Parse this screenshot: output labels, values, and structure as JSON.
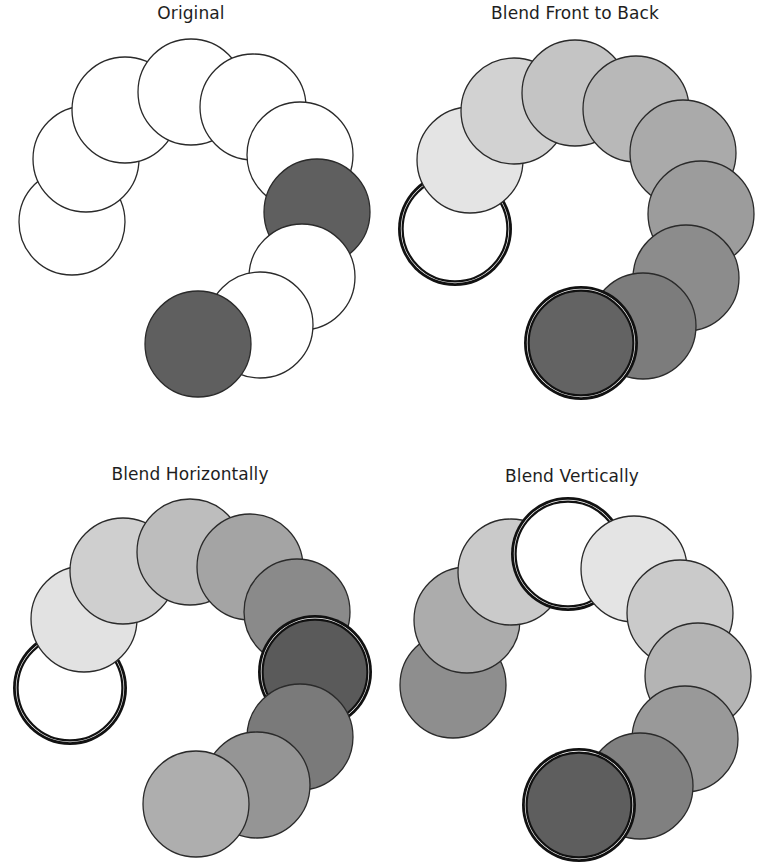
{
  "figure": {
    "circle_radius": 53,
    "stroke_color": "#2a2a2a",
    "panels": [
      {
        "id": "original",
        "title": "Original",
        "title_pos": [
          191,
          3
        ],
        "circles": [
          {
            "cx": 72,
            "cy": 222,
            "fill": "#ffffff",
            "selected": false
          },
          {
            "cx": 86,
            "cy": 159,
            "fill": "#ffffff",
            "selected": false
          },
          {
            "cx": 125,
            "cy": 110,
            "fill": "#ffffff",
            "selected": false
          },
          {
            "cx": 191,
            "cy": 92,
            "fill": "#ffffff",
            "selected": false
          },
          {
            "cx": 253,
            "cy": 107,
            "fill": "#ffffff",
            "selected": false
          },
          {
            "cx": 300,
            "cy": 155,
            "fill": "#ffffff",
            "selected": false
          },
          {
            "cx": 317,
            "cy": 212,
            "fill": "#5f5f5f",
            "selected": false
          },
          {
            "cx": 302,
            "cy": 277,
            "fill": "#ffffff",
            "selected": false
          },
          {
            "cx": 260,
            "cy": 325,
            "fill": "#ffffff",
            "selected": false
          },
          {
            "cx": 198,
            "cy": 344,
            "fill": "#5f5f5f",
            "selected": false
          }
        ]
      },
      {
        "id": "blend-front-to-back",
        "title": "Blend Front to Back",
        "title_pos": [
          575,
          3
        ],
        "circles": [
          {
            "cx": 455,
            "cy": 229,
            "fill": "#ffffff",
            "selected": true
          },
          {
            "cx": 470,
            "cy": 160,
            "fill": "#e4e4e4",
            "selected": false
          },
          {
            "cx": 514,
            "cy": 111,
            "fill": "#d2d2d2",
            "selected": false
          },
          {
            "cx": 575,
            "cy": 93,
            "fill": "#c4c4c4",
            "selected": false
          },
          {
            "cx": 636,
            "cy": 109,
            "fill": "#b8b8b8",
            "selected": false
          },
          {
            "cx": 683,
            "cy": 153,
            "fill": "#aaaaaa",
            "selected": false
          },
          {
            "cx": 701,
            "cy": 214,
            "fill": "#9c9c9c",
            "selected": false
          },
          {
            "cx": 686,
            "cy": 278,
            "fill": "#8c8c8c",
            "selected": false
          },
          {
            "cx": 643,
            "cy": 326,
            "fill": "#7c7c7c",
            "selected": false
          },
          {
            "cx": 581,
            "cy": 343,
            "fill": "#636363",
            "selected": true
          }
        ]
      },
      {
        "id": "blend-horizontally",
        "title": "Blend Horizontally",
        "title_pos": [
          190,
          464
        ],
        "circles": [
          {
            "cx": 70,
            "cy": 688,
            "fill": "#ffffff",
            "selected": true
          },
          {
            "cx": 84,
            "cy": 619,
            "fill": "#e2e2e2",
            "selected": false
          },
          {
            "cx": 123,
            "cy": 571,
            "fill": "#cfcfcf",
            "selected": false
          },
          {
            "cx": 190,
            "cy": 552,
            "fill": "#bdbdbd",
            "selected": false
          },
          {
            "cx": 250,
            "cy": 567,
            "fill": "#a4a4a4",
            "selected": false
          },
          {
            "cx": 297,
            "cy": 612,
            "fill": "#8a8a8a",
            "selected": false
          },
          {
            "cx": 315,
            "cy": 672,
            "fill": "#5a5a5a",
            "selected": true
          },
          {
            "cx": 300,
            "cy": 737,
            "fill": "#7a7a7a",
            "selected": false
          },
          {
            "cx": 257,
            "cy": 785,
            "fill": "#959595",
            "selected": false
          },
          {
            "cx": 196,
            "cy": 804,
            "fill": "#aeaeae",
            "selected": false
          }
        ]
      },
      {
        "id": "blend-vertically",
        "title": "Blend Vertically",
        "title_pos": [
          572,
          466
        ],
        "circles": [
          {
            "cx": 453,
            "cy": 685,
            "fill": "#8e8e8e",
            "selected": false
          },
          {
            "cx": 467,
            "cy": 620,
            "fill": "#acacac",
            "selected": false
          },
          {
            "cx": 511,
            "cy": 572,
            "fill": "#cacaca",
            "selected": false
          },
          {
            "cx": 568,
            "cy": 554,
            "fill": "#ffffff",
            "selected": true
          },
          {
            "cx": 634,
            "cy": 569,
            "fill": "#e4e4e4",
            "selected": false
          },
          {
            "cx": 680,
            "cy": 613,
            "fill": "#cacaca",
            "selected": false
          },
          {
            "cx": 698,
            "cy": 676,
            "fill": "#b4b4b4",
            "selected": false
          },
          {
            "cx": 685,
            "cy": 739,
            "fill": "#999999",
            "selected": false
          },
          {
            "cx": 640,
            "cy": 786,
            "fill": "#808080",
            "selected": false
          },
          {
            "cx": 579,
            "cy": 805,
            "fill": "#5e5e5e",
            "selected": true
          }
        ]
      }
    ]
  }
}
